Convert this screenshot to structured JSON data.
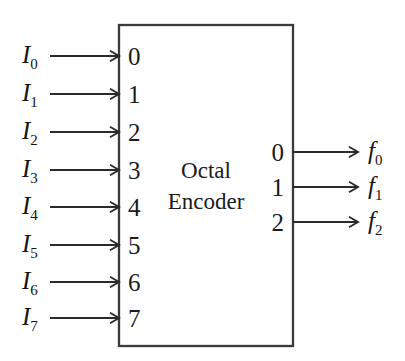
{
  "diagram": {
    "kind": "logic-block-diagram",
    "background_color": "#ffffff",
    "line_color": "#2b2b2b",
    "text_color": "#1b1b1b",
    "block": {
      "title_line1": "Octal",
      "title_line2": "Encoder",
      "x": 119,
      "y": 25,
      "width": 174,
      "height": 321
    },
    "inputs": [
      {
        "label_base": "I",
        "label_sub": "0",
        "pin": "0",
        "y": 56
      },
      {
        "label_base": "I",
        "label_sub": "1",
        "pin": "1",
        "y": 94
      },
      {
        "label_base": "I",
        "label_sub": "2",
        "pin": "2",
        "y": 132
      },
      {
        "label_base": "I",
        "label_sub": "3",
        "pin": "3",
        "y": 170
      },
      {
        "label_base": "I",
        "label_sub": "4",
        "pin": "4",
        "y": 207
      },
      {
        "label_base": "I",
        "label_sub": "5",
        "pin": "5",
        "y": 245
      },
      {
        "label_base": "I",
        "label_sub": "6",
        "pin": "6",
        "y": 282
      },
      {
        "label_base": "I",
        "label_sub": "7",
        "pin": "7",
        "y": 318
      }
    ],
    "outputs": [
      {
        "label_base": "f",
        "label_sub": "0",
        "pin": "0",
        "y": 152
      },
      {
        "label_base": "f",
        "label_sub": "1",
        "pin": "1",
        "y": 187
      },
      {
        "label_base": "f",
        "label_sub": "2",
        "pin": "2",
        "y": 222
      }
    ]
  }
}
